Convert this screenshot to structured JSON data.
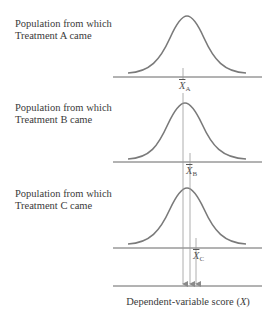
{
  "panels": [
    {
      "id": "A",
      "label_line1": "Population from which",
      "label_line2": "Treatment A came",
      "mean_symbol": "X",
      "mean_subscript": "A",
      "baseline_y": 77,
      "mean_x": 183,
      "curve_center_x": 187,
      "curve_peak_y": 16
    },
    {
      "id": "B",
      "label_line1": "Population from which",
      "label_line2": "Treatment B came",
      "mean_symbol": "X",
      "mean_subscript": "B",
      "baseline_y": 162,
      "mean_x": 190,
      "curve_center_x": 185,
      "curve_peak_y": 103
    },
    {
      "id": "C",
      "label_line1": "Population from which",
      "label_line2": "Treatment C came",
      "mean_symbol": "X",
      "mean_subscript": "C",
      "baseline_y": 248,
      "mean_x": 196,
      "curve_center_x": 187,
      "curve_peak_y": 188
    }
  ],
  "axis": {
    "label_prefix": "Dependent-variable score (",
    "label_var": "X",
    "label_suffix": ")",
    "y": 286
  },
  "colors": {
    "curve": "#7a7a7a",
    "line": "#555555",
    "mean_line": "#9a9a9a"
  }
}
